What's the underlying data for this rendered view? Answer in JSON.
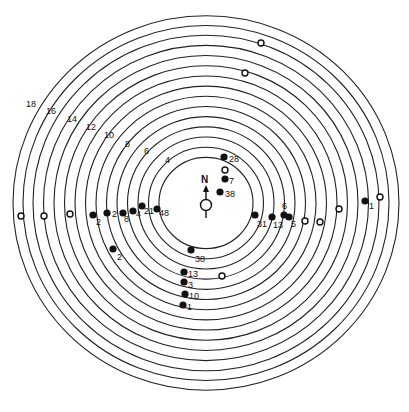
{
  "diagram": {
    "center": {
      "x": 206,
      "y": 203
    },
    "north_label": "N",
    "ring_radii": [
      47,
      57.5,
      68,
      78.5,
      89,
      99.5,
      110,
      120.5,
      131,
      141.5,
      152,
      162.5,
      173,
      183,
      193
    ],
    "ring_labels": [
      {
        "text": "4",
        "x": 165,
        "y": 163
      },
      {
        "text": "6",
        "x": 144,
        "y": 154
      },
      {
        "text": "8",
        "x": 125,
        "y": 147
      },
      {
        "text": "10",
        "x": 104,
        "y": 138
      },
      {
        "text": "12",
        "x": 86,
        "y": 130
      },
      {
        "text": "14",
        "x": 67,
        "y": 122
      },
      {
        "text": "16",
        "x": 46,
        "y": 114
      },
      {
        "text": "18",
        "x": 26,
        "y": 107
      }
    ],
    "filled_points": [
      {
        "x": 93,
        "y": 215,
        "label": "2",
        "lx": 96,
        "ly": 225
      },
      {
        "x": 107,
        "y": 213,
        "label": "2",
        "lx": 112,
        "ly": 217
      },
      {
        "x": 123,
        "y": 213,
        "label": "8",
        "lx": 124,
        "ly": 222
      },
      {
        "x": 133,
        "y": 211,
        "label": "4",
        "lx": 136,
        "ly": 217
      },
      {
        "x": 142,
        "y": 206,
        "label": "21",
        "lx": 144,
        "ly": 214
      },
      {
        "x": 157,
        "y": 209,
        "label": "48",
        "lx": 159,
        "ly": 216
      },
      {
        "x": 113,
        "y": 249,
        "label": "2",
        "lx": 117,
        "ly": 260
      },
      {
        "x": 224,
        "y": 157,
        "label": "28",
        "lx": 229,
        "ly": 162
      },
      {
        "x": 225,
        "y": 179,
        "label": "7",
        "lx": 229,
        "ly": 184
      },
      {
        "x": 220,
        "y": 192,
        "label": "38",
        "lx": 225,
        "ly": 197
      },
      {
        "x": 255,
        "y": 215,
        "label": "31",
        "lx": 257,
        "ly": 227
      },
      {
        "x": 272,
        "y": 217,
        "label": "13",
        "lx": 273,
        "ly": 228
      },
      {
        "x": 284,
        "y": 215,
        "label": "6",
        "lx": 282,
        "ly": 209
      },
      {
        "x": 289,
        "y": 217,
        "label": "5",
        "lx": 291,
        "ly": 227
      },
      {
        "x": 365,
        "y": 201,
        "label": "1",
        "lx": 369,
        "ly": 209
      },
      {
        "x": 191,
        "y": 250,
        "label": "38",
        "lx": 195,
        "ly": 262
      },
      {
        "x": 184,
        "y": 272,
        "label": "13",
        "lx": 188,
        "ly": 277
      },
      {
        "x": 184,
        "y": 282,
        "label": "3",
        "lx": 188,
        "ly": 288
      },
      {
        "x": 185,
        "y": 294,
        "label": "10",
        "lx": 189,
        "ly": 299
      },
      {
        "x": 183,
        "y": 305,
        "label": "1",
        "lx": 187,
        "ly": 310
      }
    ],
    "open_points": [
      {
        "x": 21,
        "y": 216
      },
      {
        "x": 44,
        "y": 216
      },
      {
        "x": 70,
        "y": 214
      },
      {
        "x": 305,
        "y": 221
      },
      {
        "x": 320,
        "y": 222
      },
      {
        "x": 339,
        "y": 209
      },
      {
        "x": 380,
        "y": 197
      },
      {
        "x": 261,
        "y": 43
      },
      {
        "x": 245,
        "y": 73
      },
      {
        "x": 225,
        "y": 170
      },
      {
        "x": 222,
        "y": 276
      }
    ]
  }
}
